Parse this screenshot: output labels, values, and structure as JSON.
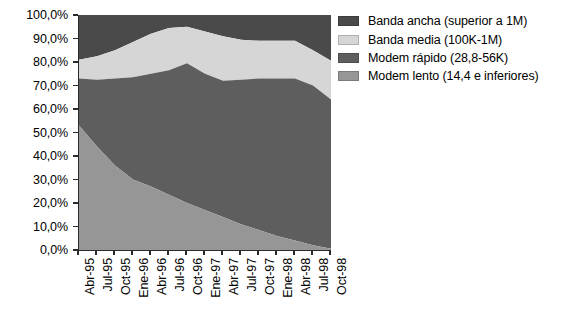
{
  "chart_data": {
    "type": "area",
    "stacked": true,
    "title": "",
    "subtitle": "",
    "xlabel": "",
    "ylabel": "",
    "ylim": [
      0,
      100
    ],
    "ytick_format": "0,0%",
    "grid": false,
    "legend_position": "right",
    "categories": [
      "Abr-95",
      "Jul-95",
      "Oct-95",
      "Ene-96",
      "Abr-96",
      "Jul-96",
      "Oct-96",
      "Ene-97",
      "Abr-97",
      "Jul-97",
      "Oct-97",
      "Ene-98",
      "Abr-98",
      "Jul-98",
      "Oct-98"
    ],
    "ytick_labels": [
      "0,0%",
      "10,0%",
      "20,0%",
      "30,0%",
      "40,0%",
      "50,0%",
      "60,0%",
      "70,0%",
      "80,0%",
      "90,0%",
      "100,0%"
    ],
    "ytick_values": [
      0,
      10,
      20,
      30,
      40,
      50,
      60,
      70,
      80,
      90,
      100
    ],
    "series": [
      {
        "name": "Modem lento (14,4 e inferiores)",
        "color": "#969696",
        "values": [
          53.0,
          44.0,
          36.0,
          30.0,
          27.0,
          23.5,
          20.0,
          17.0,
          14.0,
          11.0,
          8.5,
          6.0,
          4.0,
          2.0,
          0.5
        ]
      },
      {
        "name": "Modem rápido (28,8-56K)",
        "color": "#5e5e5e",
        "values": [
          20.0,
          28.5,
          37.0,
          43.5,
          48.0,
          53.0,
          59.5,
          58.0,
          58.0,
          61.5,
          64.5,
          67.0,
          69.0,
          68.0,
          63.5
        ]
      },
      {
        "name": "Banda media (100K-1M)",
        "color": "#d6d6d6",
        "values": [
          8.0,
          10.0,
          12.0,
          15.0,
          17.0,
          18.0,
          15.5,
          18.0,
          19.0,
          17.0,
          16.0,
          16.0,
          16.0,
          15.0,
          16.5
        ]
      },
      {
        "name": "Banda ancha (superior a 1M)",
        "color": "#4a4a4a",
        "values": [
          19.0,
          17.5,
          15.0,
          11.5,
          8.0,
          5.5,
          5.0,
          7.0,
          9.0,
          10.5,
          11.0,
          11.0,
          11.0,
          15.0,
          19.5
        ]
      }
    ],
    "legend": [
      {
        "label": "Banda ancha (superior a 1M)",
        "color": "#4a4a4a"
      },
      {
        "label": "Banda media (100K-1M)",
        "color": "#d6d6d6"
      },
      {
        "label": "Modem rápido (28,8-56K)",
        "color": "#5e5e5e"
      },
      {
        "label": "Modem lento (14,4 e inferiores)",
        "color": "#969696"
      }
    ]
  },
  "colors": {
    "axis": "#2b2b2b",
    "text": "#000000",
    "background": "#ffffff"
  }
}
